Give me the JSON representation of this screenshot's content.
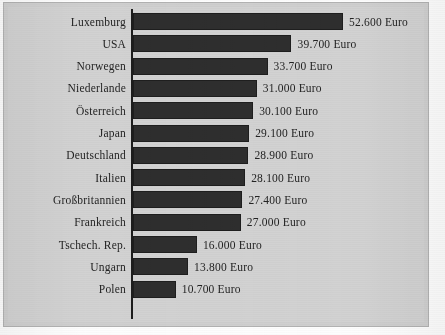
{
  "chart_data": {
    "type": "bar",
    "orientation": "horizontal",
    "title": "",
    "subtitle": "",
    "xlabel": "",
    "ylabel": "",
    "unit": "Euro",
    "grid": false,
    "legend": null,
    "xlim": [
      0,
      52600
    ],
    "axis_line": "vertical category axis at zero",
    "categories": [
      "Luxemburg",
      "USA",
      "Norwegen",
      "Niederlande",
      "Österreich",
      "Japan",
      "Deutschland",
      "Italien",
      "Großbritannien",
      "Frankreich",
      "Tschech. Rep.",
      "Ungarn",
      "Polen"
    ],
    "values": [
      52600,
      39700,
      33700,
      31000,
      30100,
      29100,
      28900,
      28100,
      27400,
      27000,
      16000,
      13800,
      10700
    ],
    "value_labels": [
      "52.600 Euro",
      "39.700 Euro",
      "33.700 Euro",
      "31.000 Euro",
      "30.100 Euro",
      "29.100 Euro",
      "28.900 Euro",
      "28.100 Euro",
      "27.400 Euro",
      "27.000 Euro",
      "16.000 Euro",
      "13.800 Euro",
      "10.700 Euro"
    ],
    "colors": {
      "bar": "#2e2e2e",
      "axis": "#1d1d1d",
      "text": "#232323",
      "background": "#d2d2d2",
      "frame": "#b3b3b3"
    }
  }
}
